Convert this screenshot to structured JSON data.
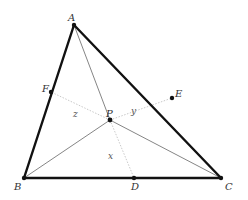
{
  "diagram": {
    "type": "triangle-cevians",
    "colors": {
      "triangle_stroke": "#111111",
      "cevian_solid": "#666666",
      "cevian_dotted": "#bbbbbb",
      "point_fill": "#111111",
      "label": "#333333"
    },
    "points": {
      "A": {
        "label": "A",
        "x": 74,
        "y": 25
      },
      "B": {
        "label": "B",
        "x": 24,
        "y": 178
      },
      "C": {
        "label": "C",
        "x": 221,
        "y": 178
      },
      "D": {
        "label": "D",
        "x": 134,
        "y": 178
      },
      "E": {
        "label": "E",
        "x": 172,
        "y": 98
      },
      "F": {
        "label": "F",
        "x": 51,
        "y": 92
      },
      "P": {
        "label": "P",
        "x": 110,
        "y": 120
      }
    },
    "region_labels": {
      "x": "x",
      "y": "y",
      "z": "z"
    }
  }
}
